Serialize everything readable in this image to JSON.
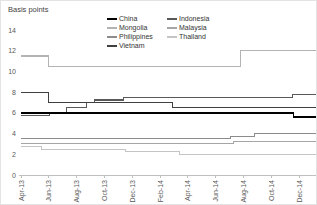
{
  "title": "Basis points",
  "chart_data": {
    "type": "line",
    "title": "Basis points",
    "xlabel": "",
    "ylabel": "Basis points",
    "x_unit": "months since Apr-2013",
    "ylim": [
      0,
      14
    ],
    "y_ticks": [
      0,
      2,
      4,
      6,
      8,
      10,
      12,
      14
    ],
    "x_ticks": [
      {
        "month": 0,
        "label": "Apr-13"
      },
      {
        "month": 2,
        "label": "Jun-13"
      },
      {
        "month": 4,
        "label": "Aug-13"
      },
      {
        "month": 6,
        "label": "Oct-13"
      },
      {
        "month": 8,
        "label": "Dec-13"
      },
      {
        "month": 10,
        "label": "Feb-14"
      },
      {
        "month": 12,
        "label": "Apr-14"
      },
      {
        "month": 14,
        "label": "Jun-14"
      },
      {
        "month": 16,
        "label": "Aug-14"
      },
      {
        "month": 18,
        "label": "Oct-14"
      },
      {
        "month": 20,
        "label": "Dec-14"
      }
    ],
    "grid": false,
    "legend_position": "top",
    "legend_columns": [
      [
        0,
        2,
        4,
        6
      ],
      [
        1,
        3,
        5
      ]
    ],
    "series": [
      {
        "name": "China",
        "color": "#000000",
        "width": 1.6,
        "points": [
          [
            0,
            6.0
          ],
          [
            19.6,
            6.0
          ],
          [
            19.6,
            5.6
          ],
          [
            21.2,
            5.6
          ]
        ]
      },
      {
        "name": "Indonesia",
        "color": "#595959",
        "width": 1.1,
        "points": [
          [
            0,
            5.75
          ],
          [
            2.05,
            5.75
          ],
          [
            2.05,
            6.0
          ],
          [
            3.25,
            6.0
          ],
          [
            3.25,
            6.5
          ],
          [
            4.7,
            6.5
          ],
          [
            4.7,
            7.0
          ],
          [
            5.3,
            7.0
          ],
          [
            5.3,
            7.25
          ],
          [
            7.35,
            7.25
          ],
          [
            7.35,
            7.5
          ],
          [
            19.5,
            7.5
          ],
          [
            19.5,
            7.75
          ],
          [
            21.2,
            7.75
          ]
        ]
      },
      {
        "name": "Mongolia",
        "color": "#b3b3b3",
        "width": 1.1,
        "points": [
          [
            0,
            11.5
          ],
          [
            2.0,
            11.5
          ],
          [
            2.0,
            10.5
          ],
          [
            15.8,
            10.5
          ],
          [
            15.8,
            12.0
          ],
          [
            21.2,
            12.0
          ]
        ]
      },
      {
        "name": "Malaysia",
        "color": "#a6a6a6",
        "width": 1.1,
        "points": [
          [
            0,
            3.0
          ],
          [
            15.3,
            3.0
          ],
          [
            15.3,
            3.25
          ],
          [
            21.2,
            3.25
          ]
        ]
      },
      {
        "name": "Philippines",
        "color": "#8c8c8c",
        "width": 1.1,
        "points": [
          [
            0,
            3.5
          ],
          [
            15.1,
            3.5
          ],
          [
            15.1,
            3.75
          ],
          [
            16.8,
            3.75
          ],
          [
            16.8,
            4.0
          ],
          [
            21.2,
            4.0
          ]
        ]
      },
      {
        "name": "Thailand",
        "color": "#c4c4c4",
        "width": 1.1,
        "points": [
          [
            0,
            2.75
          ],
          [
            1.5,
            2.75
          ],
          [
            1.5,
            2.5
          ],
          [
            7.55,
            2.5
          ],
          [
            7.55,
            2.25
          ],
          [
            11.4,
            2.25
          ],
          [
            11.4,
            2.0
          ],
          [
            21.2,
            2.0
          ]
        ]
      },
      {
        "name": "Vietnam",
        "color": "#404040",
        "width": 1.3,
        "points": [
          [
            0,
            8.0
          ],
          [
            2.0,
            8.0
          ],
          [
            2.0,
            7.0
          ],
          [
            10.9,
            7.0
          ],
          [
            10.9,
            6.5
          ],
          [
            21.2,
            6.5
          ]
        ]
      }
    ],
    "axis_color": "#bfbfbf",
    "label_color": "#595959"
  }
}
